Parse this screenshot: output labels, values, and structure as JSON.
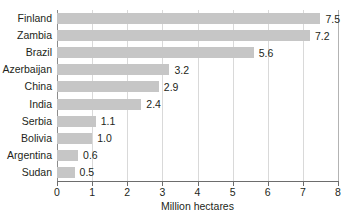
{
  "chart_data": {
    "type": "bar",
    "orientation": "horizontal",
    "title": "",
    "xlabel": "Million hectares",
    "ylabel": "",
    "xlim": [
      0,
      8
    ],
    "xticks": [
      0,
      1,
      2,
      3,
      4,
      5,
      6,
      7,
      8
    ],
    "xtick_labels": [
      "0",
      "1",
      "2",
      "3",
      "4",
      "5",
      "6",
      "7",
      "8"
    ],
    "grid": "vertical",
    "legend": "none",
    "categories": [
      "Finland",
      "Zambia",
      "Brazil",
      "Azerbaijan",
      "China",
      "India",
      "Serbia",
      "Bolivia",
      "Argentina",
      "Sudan"
    ],
    "values": [
      7.5,
      7.2,
      5.6,
      3.2,
      2.9,
      2.4,
      1.1,
      1.0,
      0.6,
      0.5
    ],
    "value_labels": [
      "7.5",
      "7.2",
      "5.6",
      "3.2",
      "2.9",
      "2.4",
      "1.1",
      "1.0",
      "0.6",
      "0.5"
    ],
    "colors": {
      "bar_fill": "#c6c6c6",
      "background": "#ffffff",
      "gridline": "#d9d9d9",
      "axis_line": "#6d6d6d",
      "text": "#231f20"
    }
  }
}
